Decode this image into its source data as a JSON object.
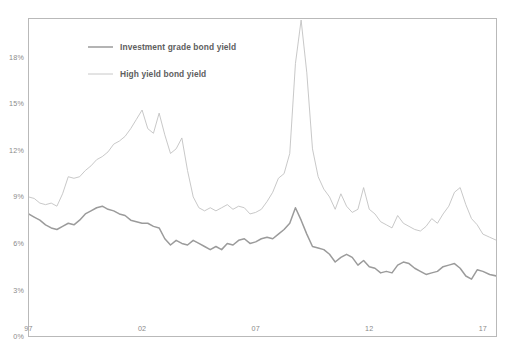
{
  "chart_data": {
    "type": "line",
    "title": "",
    "subtitle": "",
    "xlabel": "",
    "ylabel": "",
    "grid": false,
    "legend_position": "top-left-inside",
    "ylim": [
      0,
      20.5
    ],
    "ytick_values": [
      0,
      3,
      6,
      9,
      12,
      15,
      18
    ],
    "ytick_labels": [
      "0%",
      "3%",
      "6%",
      "9%",
      "12%",
      "15%",
      "18%"
    ],
    "xlim": [
      1997.0,
      2017.6
    ],
    "xtick_values": [
      1997,
      2002,
      2007,
      2012,
      2017
    ],
    "xtick_labels": [
      "97",
      "02",
      "07",
      "12",
      "17"
    ],
    "colors": {
      "investment_grade": "#9b9b9b",
      "high_yield": "#c2c2c2",
      "frame": "#b9b9b9",
      "tick_label": "#8a8a8a",
      "legend_label": "#5e5e5e",
      "background": "#ffffff"
    },
    "series": [
      {
        "name": "Investment grade bond yield",
        "color": "#9b9b9b",
        "line_width": 1.5,
        "x": [
          1997.0,
          1997.25,
          1997.5,
          1997.75,
          1998.0,
          1998.25,
          1998.5,
          1998.75,
          1999.0,
          1999.25,
          1999.5,
          1999.75,
          2000.0,
          2000.25,
          2000.5,
          2000.75,
          2001.0,
          2001.25,
          2001.5,
          2001.75,
          2002.0,
          2002.25,
          2002.5,
          2002.75,
          2003.0,
          2003.25,
          2003.5,
          2003.75,
          2004.0,
          2004.25,
          2004.5,
          2004.75,
          2005.0,
          2005.25,
          2005.5,
          2005.75,
          2006.0,
          2006.25,
          2006.5,
          2006.75,
          2007.0,
          2007.25,
          2007.5,
          2007.75,
          2008.0,
          2008.25,
          2008.5,
          2008.75,
          2009.0,
          2009.25,
          2009.5,
          2009.75,
          2010.0,
          2010.25,
          2010.5,
          2010.75,
          2011.0,
          2011.25,
          2011.5,
          2011.75,
          2012.0,
          2012.25,
          2012.5,
          2012.75,
          2013.0,
          2013.25,
          2013.5,
          2013.75,
          2014.0,
          2014.25,
          2014.5,
          2014.75,
          2015.0,
          2015.25,
          2015.5,
          2015.75,
          2016.0,
          2016.25,
          2016.5,
          2016.75,
          2017.0,
          2017.3,
          2017.6
        ],
        "values": [
          7.9,
          7.7,
          7.5,
          7.2,
          7.0,
          6.9,
          7.1,
          7.3,
          7.2,
          7.5,
          7.9,
          8.1,
          8.3,
          8.4,
          8.2,
          8.1,
          7.9,
          7.8,
          7.5,
          7.4,
          7.3,
          7.3,
          7.1,
          7.0,
          6.3,
          5.9,
          6.2,
          6.0,
          5.9,
          6.2,
          6.0,
          5.8,
          5.6,
          5.8,
          5.6,
          6.0,
          5.9,
          6.2,
          6.3,
          6.0,
          6.1,
          6.3,
          6.4,
          6.3,
          6.6,
          6.9,
          7.3,
          8.3,
          7.5,
          6.6,
          5.8,
          5.7,
          5.6,
          5.3,
          4.8,
          5.1,
          5.3,
          5.1,
          4.6,
          4.9,
          4.5,
          4.4,
          4.1,
          4.2,
          4.1,
          4.6,
          4.8,
          4.7,
          4.4,
          4.2,
          4.0,
          4.1,
          4.2,
          4.5,
          4.6,
          4.7,
          4.4,
          3.9,
          3.7,
          4.3,
          4.2,
          4.0,
          3.9
        ]
      },
      {
        "name": "High yield bond yield",
        "color": "#c2c2c2",
        "line_width": 0.9,
        "x": [
          1997.0,
          1997.25,
          1997.5,
          1997.75,
          1998.0,
          1998.25,
          1998.5,
          1998.75,
          1999.0,
          1999.25,
          1999.5,
          1999.75,
          2000.0,
          2000.25,
          2000.5,
          2000.75,
          2001.0,
          2001.25,
          2001.5,
          2001.75,
          2002.0,
          2002.25,
          2002.5,
          2002.75,
          2003.0,
          2003.25,
          2003.5,
          2003.75,
          2004.0,
          2004.25,
          2004.5,
          2004.75,
          2005.0,
          2005.25,
          2005.5,
          2005.75,
          2006.0,
          2006.25,
          2006.5,
          2006.75,
          2007.0,
          2007.25,
          2007.5,
          2007.75,
          2008.0,
          2008.25,
          2008.5,
          2008.75,
          2009.0,
          2009.25,
          2009.5,
          2009.75,
          2010.0,
          2010.25,
          2010.5,
          2010.75,
          2011.0,
          2011.25,
          2011.5,
          2011.75,
          2012.0,
          2012.25,
          2012.5,
          2012.75,
          2013.0,
          2013.25,
          2013.5,
          2013.75,
          2014.0,
          2014.25,
          2014.5,
          2014.75,
          2015.0,
          2015.25,
          2015.5,
          2015.75,
          2016.0,
          2016.25,
          2016.5,
          2016.75,
          2017.0,
          2017.3,
          2017.6
        ],
        "values": [
          9.0,
          8.9,
          8.6,
          8.5,
          8.6,
          8.4,
          9.2,
          10.3,
          10.2,
          10.3,
          10.7,
          11.0,
          11.4,
          11.6,
          11.9,
          12.4,
          12.6,
          12.9,
          13.4,
          14.0,
          14.6,
          13.4,
          13.1,
          14.4,
          13.0,
          11.8,
          12.1,
          12.8,
          10.7,
          9.0,
          8.3,
          8.1,
          8.3,
          8.1,
          8.3,
          8.5,
          8.2,
          8.4,
          8.3,
          7.9,
          8.0,
          8.2,
          8.7,
          9.3,
          10.2,
          10.5,
          11.8,
          17.6,
          20.4,
          17.0,
          12.1,
          10.3,
          9.5,
          9.0,
          8.2,
          9.2,
          8.4,
          8.0,
          8.2,
          9.6,
          8.2,
          7.9,
          7.4,
          7.2,
          7.0,
          7.8,
          7.3,
          7.1,
          6.9,
          6.8,
          7.1,
          7.6,
          7.3,
          7.9,
          8.4,
          9.3,
          9.6,
          8.5,
          7.6,
          7.2,
          6.6,
          6.4,
          6.2
        ]
      }
    ],
    "legend": [
      {
        "label": "Investment grade bond yield",
        "color": "#9b9b9b",
        "line_width": 1.5
      },
      {
        "label": "High yield bond yield",
        "color": "#c2c2c2",
        "line_width": 0.9
      }
    ]
  }
}
